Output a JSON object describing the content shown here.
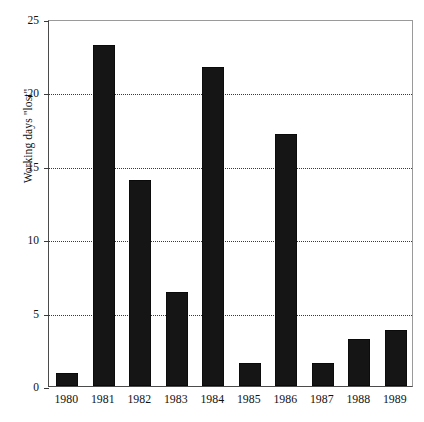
{
  "chart_data": {
    "type": "bar",
    "title": "",
    "xlabel": "",
    "ylabel": "Working days \"lost\"",
    "categories": [
      "1980",
      "1981",
      "1982",
      "1983",
      "1984",
      "1985",
      "1986",
      "1987",
      "1988",
      "1989"
    ],
    "values": [
      0.9,
      23.2,
      14.0,
      6.4,
      21.7,
      1.6,
      17.2,
      1.6,
      3.2,
      3.8
    ],
    "ylim": [
      0,
      25
    ],
    "yticks": [
      0,
      5,
      10,
      15,
      20,
      25
    ],
    "ytick_labels": [
      "0",
      "5",
      "10",
      "15",
      "20",
      "25"
    ],
    "grid": "horizontal-dotted",
    "legend": "none",
    "bar_color": "#151515",
    "series": [
      {
        "name": "Working days lost",
        "values": [
          0.9,
          23.2,
          14.0,
          6.4,
          21.7,
          1.6,
          17.2,
          1.6,
          3.2,
          3.8
        ]
      }
    ]
  },
  "caption": {
    "text": ""
  }
}
